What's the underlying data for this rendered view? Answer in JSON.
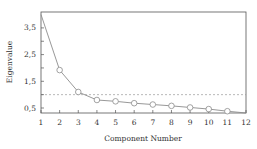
{
  "chart_data": {
    "type": "line",
    "title": "",
    "xlabel": "Component Number",
    "ylabel": "Eigenvalue",
    "x": [
      1,
      2,
      3,
      4,
      5,
      6,
      7,
      8,
      9,
      10,
      11,
      12
    ],
    "series": [
      {
        "name": "Eigenvalue",
        "values": [
          4.0,
          1.92,
          1.1,
          0.8,
          0.75,
          0.68,
          0.63,
          0.58,
          0.52,
          0.46,
          0.38,
          0.3
        ]
      }
    ],
    "reference_line": {
      "y": 1.0,
      "style": "dashed"
    },
    "xticks": [
      "1",
      "2",
      "3",
      "4",
      "5",
      "6",
      "7",
      "8",
      "9",
      "10",
      "11",
      "12"
    ],
    "yticks": [
      "0,5",
      "1,5",
      "2,5",
      "3,5"
    ],
    "xlim": [
      1,
      12
    ],
    "ylim": [
      0.3,
      4.0
    ],
    "grid": false,
    "legend": null
  },
  "colors": {
    "line": "#8c8c8c",
    "axis": "#555555",
    "refline": "#999999"
  }
}
